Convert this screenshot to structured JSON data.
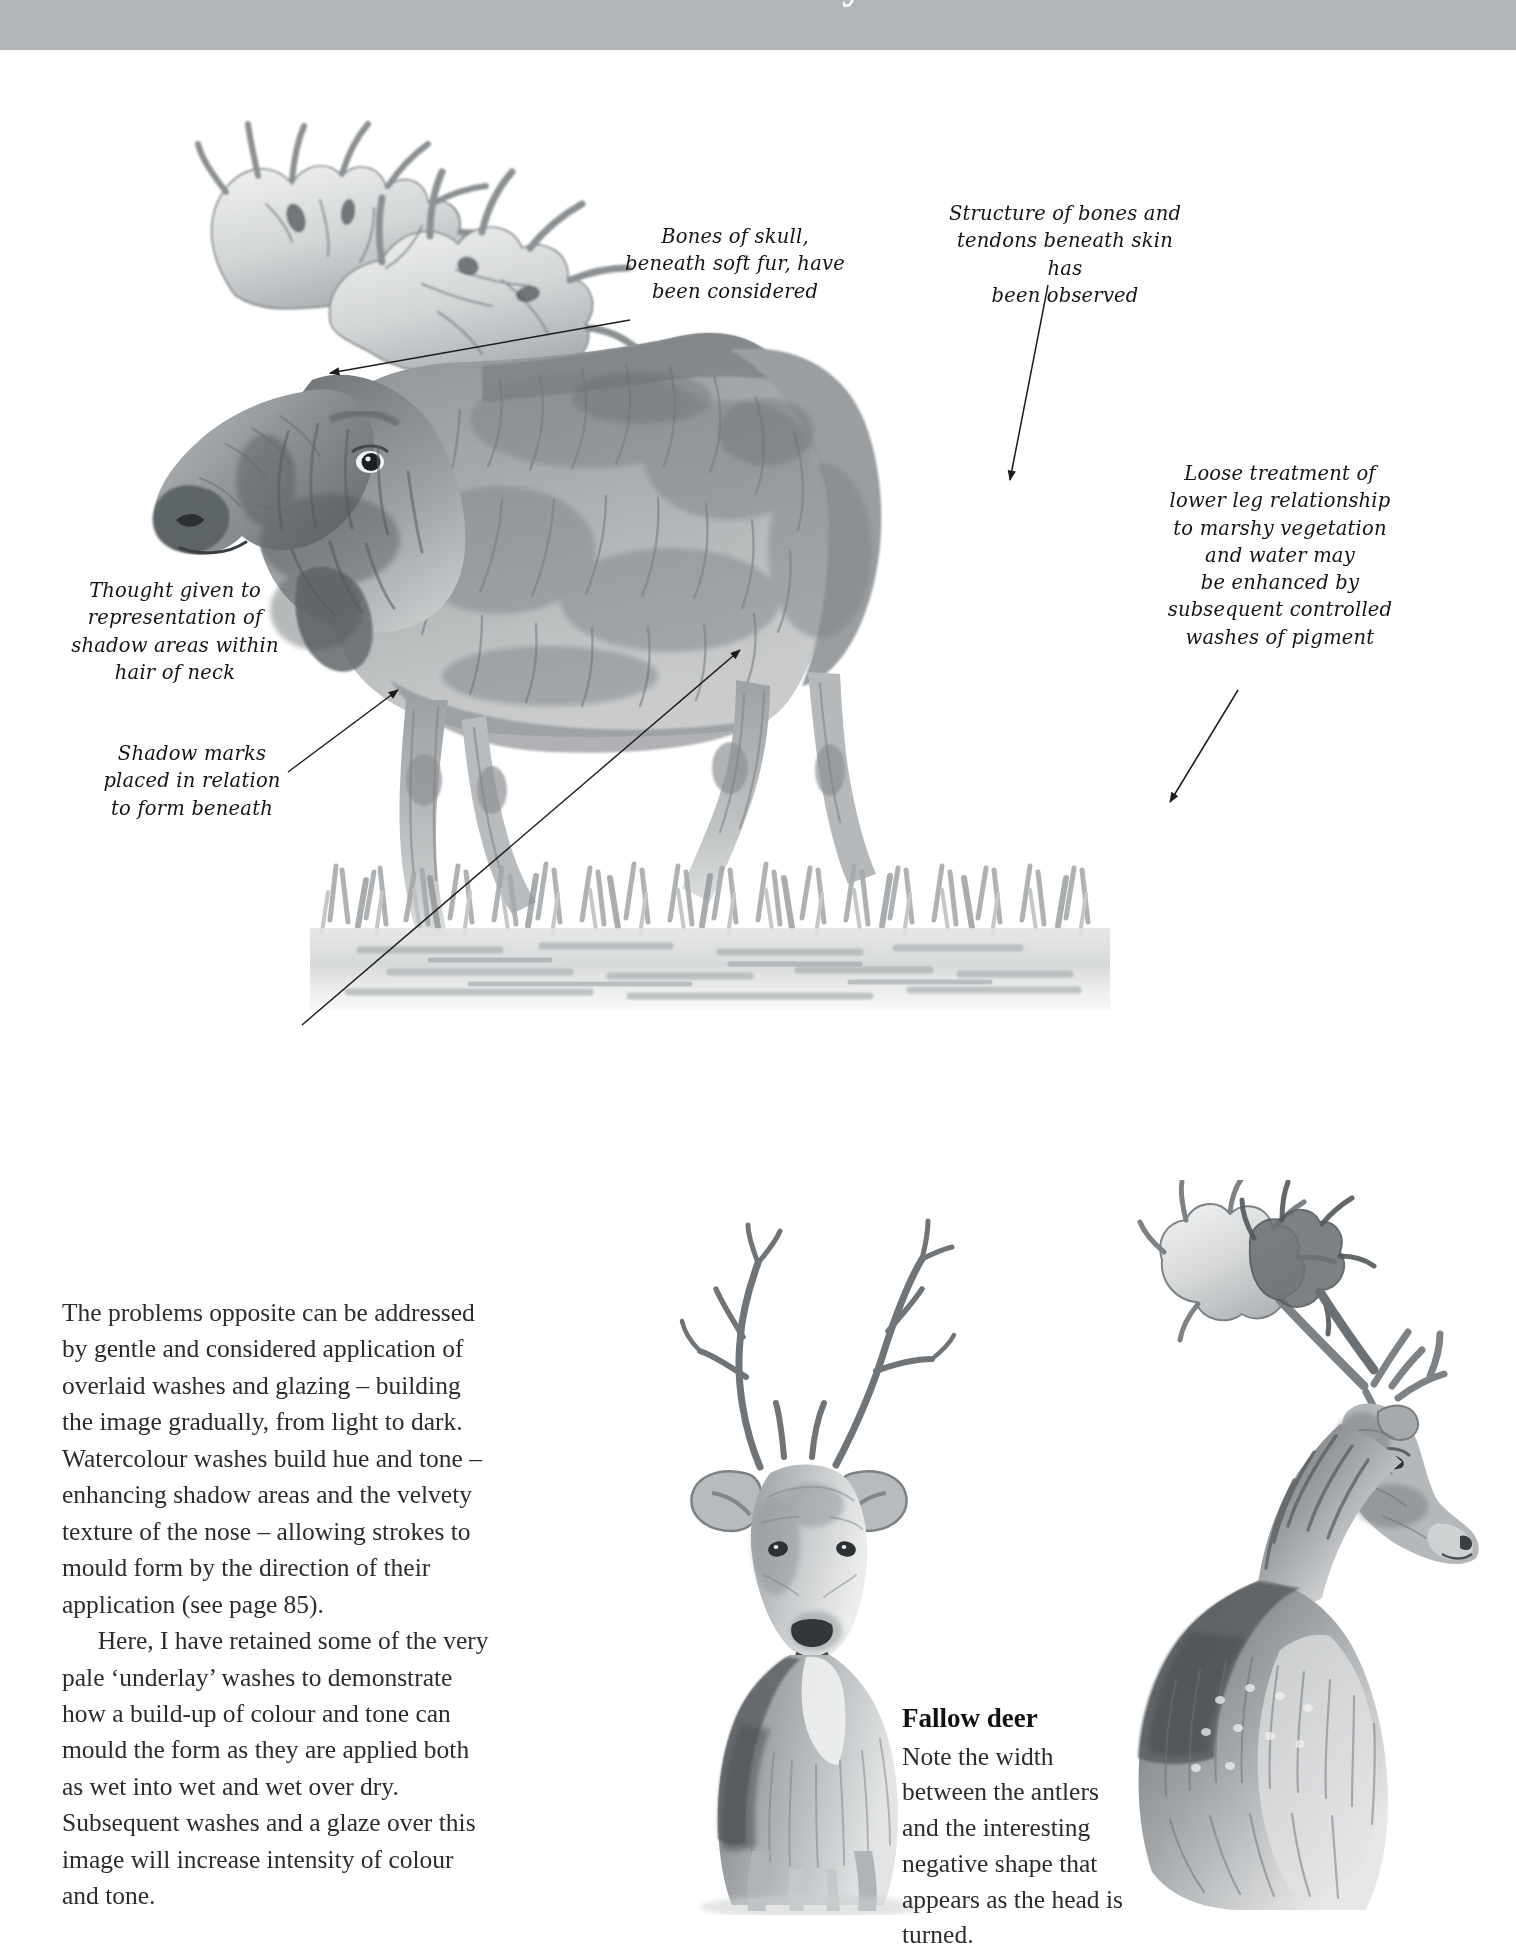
{
  "page": {
    "banner": {
      "title": "Case study"
    },
    "background_color": "#ffffff",
    "banner_color": "#b3b6b8"
  },
  "annotations": [
    {
      "id": "bones-of-skull",
      "text": "Bones of skull,\nbeneath soft fur, have\nbeen considered"
    },
    {
      "id": "structure-of-bones",
      "text": "Structure of bones and\ntendons beneath skin has\nbeen observed"
    },
    {
      "id": "loose-treatment",
      "text": "Loose treatment of\nlower leg relationship\nto marshy vegetation\nand water may\nbe enhanced by\nsubsequent controlled\nwashes of pigment"
    },
    {
      "id": "thought-given",
      "text": "Thought given to\nrepresentation of\nshadow areas within\nhair of neck"
    },
    {
      "id": "shadow-marks",
      "text": "Shadow marks\nplaced in relation\nto form beneath"
    }
  ],
  "body_copy": {
    "paragraph_1": "The problems opposite can be addressed by gentle and considered application of overlaid washes and glazing – building the image gradually, from light to dark. Watercolour washes build hue and tone – enhancing shadow areas and the velvety texture of the nose – allowing strokes to mould form by the direction of their application (see page 85).",
    "paragraph_2": "Here, I have retained some of the very pale ‘underlay’ washes to demonstrate how a build-up of colour and tone can mould the form as they are applied both as wet into wet and wet over dry. Subsequent washes and a glaze over this image will increase intensity of colour and tone."
  },
  "caption": {
    "title": "Fallow deer",
    "text": "Note the width between the antlers and the interesting negative shape that appears as the head is turned."
  },
  "illustrations": {
    "moose": {
      "name": "moose-wading-in-marsh-watercolour"
    },
    "deer_front": {
      "name": "fallow-deer-front-view-pencil"
    },
    "deer_turned": {
      "name": "fallow-deer-head-turned-pencil"
    }
  }
}
